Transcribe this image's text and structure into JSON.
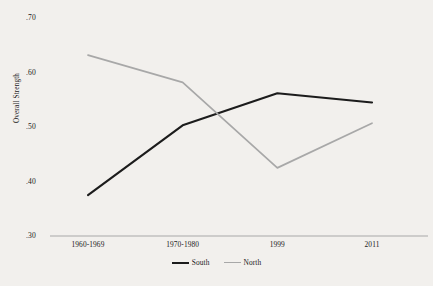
{
  "chart_data": {
    "type": "line",
    "title": "",
    "xlabel": "",
    "ylabel": "Overall Strength",
    "categories": [
      "1960-1969",
      "1970-1980",
      "1999",
      "2011"
    ],
    "ylim": [
      0.3,
      0.7
    ],
    "yticks": [
      ".30",
      ".40",
      ".50",
      ".60",
      ".70"
    ],
    "ytick_values": [
      0.3,
      0.4,
      0.5,
      0.6,
      0.7
    ],
    "grid": false,
    "legend_position": "bottom-center",
    "series": [
      {
        "name": "South",
        "color": "#1c1c1c",
        "width": 2.1,
        "values": [
          0.375,
          0.503,
          0.562,
          0.545
        ]
      },
      {
        "name": "North",
        "color": "#a8a8a8",
        "width": 1.7,
        "values": [
          0.632,
          0.582,
          0.425,
          0.507
        ]
      }
    ],
    "axis_color": "#a8a8a8",
    "background": "#f2f0ed"
  }
}
